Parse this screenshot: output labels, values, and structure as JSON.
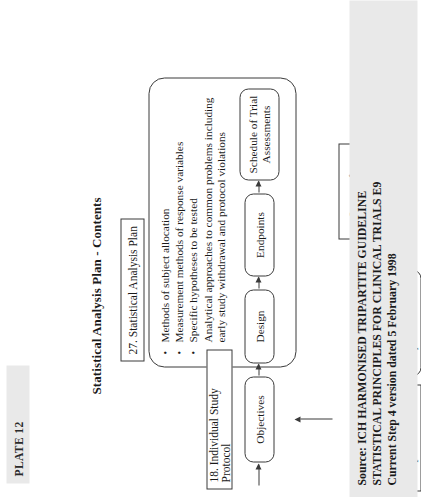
{
  "plate": {
    "label": "PLATE 12"
  },
  "legend": {
    "title": "Legend:",
    "items": [
      {
        "label": "Chapter Reference",
        "shape": "rectangle"
      },
      {
        "label": "Required Contents",
        "shape": "rounded-rectangle"
      }
    ]
  },
  "sources_key": {
    "line1": "Sources for",
    "line2": "information"
  },
  "diagram": {
    "title": "Statistical Analysis Plan - Contents",
    "chapter_reference": "27. Statistical Analysis Plan",
    "required_contents": [
      "Methods of subject allocation",
      "Measurement methods of response variables",
      "Specific hypotheses to be tested",
      "Analytical approaches to common problems including early study withdrawal and protocol violations"
    ],
    "protocol_box": "18. Individual Study Protocol",
    "flow": [
      {
        "label": "Objectives"
      },
      {
        "label": "Design"
      },
      {
        "label": "Endpoints"
      },
      {
        "label": "Schedule of Trial Assessments"
      }
    ]
  },
  "source": {
    "line1": "Source:  ICH HARMONISED TRIPARTITE GUIDELINE",
    "line2": "STATISTICAL  PRINCIPLES FOR CLINICAL TRIALS E9",
    "line3": "Current Step 4  version dated 5 February 1998"
  },
  "colors": {
    "page_background": "#ffffff",
    "ink": "#1a1a1a",
    "line": "#3a3a3a",
    "band_background": "#e9e9e9"
  }
}
